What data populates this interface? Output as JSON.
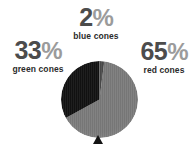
{
  "background_color": "#ffffff",
  "pie": {
    "center_x": 38.5,
    "center_y": 38.5,
    "radius": 38.5,
    "start_angle_deg": 0,
    "pointer_color": "#141414",
    "pointer_label": "bottom-marker"
  },
  "callouts": {
    "blue": {
      "percent": "2%",
      "number": "2",
      "symbol": "%",
      "label": "blue cones"
    },
    "green": {
      "percent": "33%",
      "number": "33",
      "symbol": "%",
      "label": "green cones"
    },
    "red": {
      "percent": "65%",
      "number": "65",
      "symbol": "%",
      "label": "red cones"
    }
  },
  "chart_data": {
    "type": "pie",
    "title": "",
    "subtitle": "",
    "xlabel": "",
    "ylabel": "",
    "legend_position": "callout-labels-around-pie",
    "grid": false,
    "start_angle_deg": 0,
    "direction": "clockwise",
    "categories": [
      "red cones",
      "green cones",
      "blue cones"
    ],
    "values": [
      65,
      33,
      2
    ],
    "value_labels": [
      "65%",
      "33%",
      "2%"
    ],
    "units": "percent",
    "slice_colors": [
      "#7b7b7b",
      "#121212",
      "#4a4a4a"
    ],
    "slices": [
      {
        "name": "red cones",
        "value": 65,
        "label": "65%",
        "color": "#7b7b7b",
        "start_deg": 7.2,
        "end_deg": 241.2,
        "callout": "right"
      },
      {
        "name": "green cones",
        "value": 33,
        "label": "33%",
        "color": "#121212",
        "start_deg": 241.2,
        "end_deg": 360.0,
        "callout": "left"
      },
      {
        "name": "blue cones",
        "value": 2,
        "label": "2%",
        "color": "#4a4a4a",
        "start_deg": 0.0,
        "end_deg": 7.2,
        "callout": "top"
      }
    ]
  }
}
